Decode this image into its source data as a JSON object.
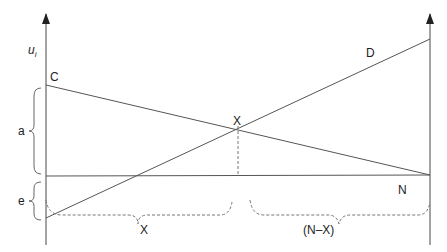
{
  "diagram": {
    "y_axis_label": "u",
    "y_axis_subscript": "i",
    "points": {
      "C": "C",
      "D": "D",
      "X_intersection": "X",
      "N": "N"
    },
    "braces": {
      "a": "a",
      "e": "e",
      "x_span": "X",
      "n_minus_x_span": "(N–X)"
    },
    "colors": {
      "line": "#555555",
      "axis": "#666666",
      "dashed": "#777777",
      "text": "#222222"
    }
  }
}
